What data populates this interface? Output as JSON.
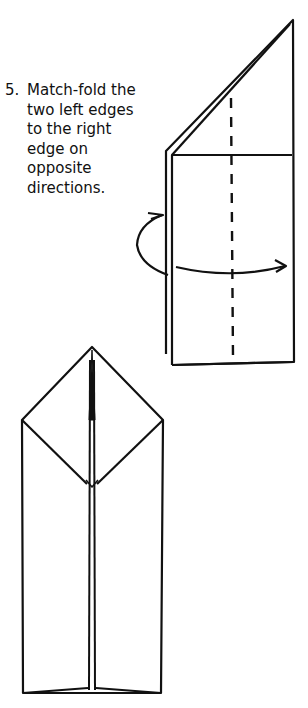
{
  "instruction": {
    "step_number": "5.",
    "text": "Match-fold the\ntwo left edges\nto the right\nedge on\nopposite\ndirections."
  },
  "diagrams": [
    {
      "name": "step-5-fold-diagram",
      "description": "Folded paper with triangular top, dashed valley fold line, curved arrows showing folds in opposite directions"
    },
    {
      "name": "step-5-result-diagram",
      "description": "Result: pointed pentagonal shape with center slit"
    }
  ],
  "colors": {
    "line": "#111111",
    "background": "#ffffff"
  }
}
